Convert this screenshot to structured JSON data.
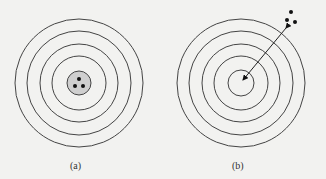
{
  "figure": {
    "panels": [
      {
        "label": "(a)",
        "description": "Concentric target with three clustered dots at the shaded center",
        "center": [
          79,
          83
        ],
        "ring_radii": [
          64,
          52,
          39,
          27
        ],
        "bullseye_radius": 12,
        "bullseye_fill": "#cfcfcf",
        "dots": [
          [
            79,
            79
          ],
          [
            75,
            86
          ],
          [
            83,
            86
          ]
        ]
      },
      {
        "label": "(b)",
        "description": "Concentric target with three clustered dots offset outside, arrow from center toward the cluster",
        "center": [
          241,
          83
        ],
        "ring_radii": [
          64,
          52,
          39,
          27,
          13
        ],
        "dots": [
          [
            291,
            12
          ],
          [
            287,
            20
          ],
          [
            295,
            22
          ]
        ],
        "arrow": {
          "from": [
            286,
            28
          ],
          "to": [
            243,
            80
          ],
          "double_headed": true
        }
      }
    ],
    "colors": {
      "line": "#444444",
      "background": "#f2f2f0",
      "dot": "#111111"
    }
  }
}
